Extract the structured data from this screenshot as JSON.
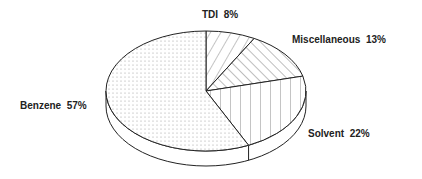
{
  "chart_data": {
    "type": "pie",
    "style": "3d-tilted",
    "title": "",
    "categories": [
      "TDI",
      "Miscellaneous",
      "Solvent",
      "Benzene"
    ],
    "values": [
      8,
      13,
      22,
      57
    ],
    "unit": "%",
    "labels": [
      {
        "name": "TDI",
        "value": "8%"
      },
      {
        "name": "Miscellaneous",
        "value": "13%"
      },
      {
        "name": "Solvent",
        "value": "22%"
      },
      {
        "name": "Benzene",
        "value": "57%"
      }
    ],
    "patterns": {
      "TDI": "diagonal-forward-hatch",
      "Miscellaneous": "diagonal-back-hatch",
      "Solvent": "vertical-hatch",
      "Benzene": "dots"
    },
    "legend": "none (direct labels)"
  }
}
